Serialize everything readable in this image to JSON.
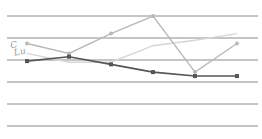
{
  "chart_data": {
    "type": "line",
    "title": "",
    "xlabel": "",
    "ylabel": "",
    "x": [
      1,
      2,
      3,
      4,
      5,
      6
    ],
    "ylim": [
      0,
      5
    ],
    "grid": true,
    "gridlines_y": [
      0,
      1,
      2,
      3,
      4,
      5
    ],
    "legend": "none",
    "series": [
      {
        "name": "series-dark",
        "color": "#555555",
        "marker": "square",
        "values": [
          2.95,
          3.15,
          2.8,
          2.45,
          2.27,
          2.27
        ]
      },
      {
        "name": "series-medium",
        "color": "#b8b8b8",
        "marker": "circle",
        "values": [
          3.75,
          3.3,
          4.2,
          5.0,
          2.45,
          3.75
        ]
      },
      {
        "name": "series-light",
        "color": "#d6d6d6",
        "marker": "none",
        "values": [
          3.3,
          2.9,
          2.9,
          3.65,
          3.9,
          4.2
        ]
      }
    ],
    "annotations": [
      {
        "text": "C",
        "note": "handwritten-style mark near left start"
      },
      {
        "text": "Lu",
        "note": "handwritten-style mark near left start"
      }
    ]
  },
  "annotation": {
    "line1": "C",
    "line2": "Lu"
  }
}
